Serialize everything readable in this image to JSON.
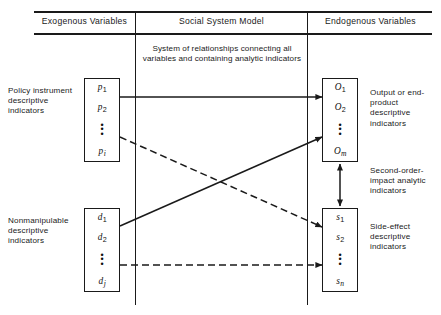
{
  "figure": {
    "columns": [
      {
        "id": "exogenous",
        "title": "Exogenous Variables"
      },
      {
        "id": "model",
        "title": "Social System Model"
      },
      {
        "id": "endogenous",
        "title": "Endogenous Variables"
      }
    ],
    "model_caption": "System of relationships connecting all variables and containing analytic indicators",
    "boxes": [
      {
        "id": "policy",
        "label": "Policy instrument descriptive indicators",
        "items": [
          {
            "base": "p",
            "sub": "1"
          },
          {
            "base": "p",
            "sub": "2"
          },
          {
            "base": "p",
            "sub": "i"
          }
        ],
        "ellipsis": "⋮"
      },
      {
        "id": "nonmanipulable",
        "label": "Nonmanipulable descriptive indicators",
        "items": [
          {
            "base": "d",
            "sub": "1"
          },
          {
            "base": "d",
            "sub": "2"
          },
          {
            "base": "d",
            "sub": "j"
          }
        ],
        "ellipsis": "⋮"
      },
      {
        "id": "output",
        "label": "Output or end-product descriptive indicators",
        "items": [
          {
            "base": "O",
            "sub": "1"
          },
          {
            "base": "O",
            "sub": "2"
          },
          {
            "base": "O",
            "sub": "m"
          }
        ],
        "ellipsis": "⋮"
      },
      {
        "id": "side_effect",
        "label": "Side-effect descriptive indicators",
        "items": [
          {
            "base": "s",
            "sub": "1"
          },
          {
            "base": "s",
            "sub": "2"
          },
          {
            "base": "s",
            "sub": "n"
          }
        ],
        "ellipsis": "⋮"
      }
    ],
    "second_order_label": "Second-order-impact analytic indicators",
    "arrows": [
      {
        "id": "policy-to-output",
        "from": "policy",
        "to": "output",
        "style": "solid",
        "heads": 1
      },
      {
        "id": "policy-to-side-effect",
        "from": "policy",
        "to": "side_effect",
        "style": "dashed",
        "heads": 1
      },
      {
        "id": "nonmanipulable-to-output",
        "from": "nonmanipulable",
        "to": "output",
        "style": "solid",
        "heads": 1
      },
      {
        "id": "nonmanipulable-to-side-effect",
        "from": "nonmanipulable",
        "to": "side_effect",
        "style": "dashed",
        "heads": 1
      },
      {
        "id": "output-side-effect-link",
        "from": "output",
        "to": "side_effect",
        "style": "solid",
        "heads": 2
      }
    ],
    "colors": {
      "ink": "#1a1a1a",
      "background": "#ffffff"
    }
  }
}
